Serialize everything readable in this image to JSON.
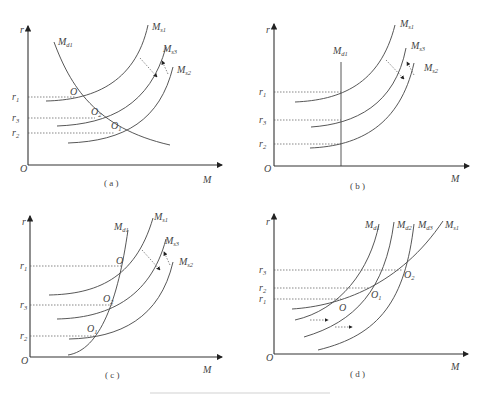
{
  "figure": {
    "caption": "",
    "panels": [
      {
        "id": "a",
        "caption": "( a )",
        "axis_y": "r",
        "axis_x": "M",
        "origin": "O",
        "curves": [
          "M_s1",
          "M_s3",
          "M_s2",
          "M_d1"
        ],
        "curve_labels": {
          "s1": "M",
          "s1_sub": "s1",
          "s3": "M",
          "s3_sub": "s3",
          "s2": "M",
          "s2_sub": "s2",
          "d1": "M",
          "d1_sub": "d1"
        },
        "rates": {
          "r1": "r",
          "r1_sub": "1",
          "r3": "r",
          "r3_sub": "3",
          "r2": "r",
          "r2_sub": "2"
        },
        "points": {
          "p0": "O",
          "p2": "O",
          "p2_sub": "2",
          "p1": "O",
          "p1_sub": "1"
        }
      },
      {
        "id": "b",
        "caption": "( b )",
        "axis_y": "r",
        "axis_x": "M",
        "origin": "O",
        "curve_labels": {
          "s1": "M",
          "s1_sub": "s1",
          "s3": "M",
          "s3_sub": "s3",
          "s2": "M",
          "s2_sub": "s2",
          "d1": "M",
          "d1_sub": "d1"
        },
        "rates": {
          "r1": "r",
          "r1_sub": "1",
          "r3": "r",
          "r3_sub": "3",
          "r2": "r",
          "r2_sub": "2"
        }
      },
      {
        "id": "c",
        "caption": "( c )",
        "axis_y": "r",
        "axis_x": "M",
        "origin": "O",
        "curve_labels": {
          "s1": "M",
          "s1_sub": "s1",
          "s3": "M",
          "s3_sub": "s3",
          "s2": "M",
          "s2_sub": "s2",
          "d1": "M",
          "d1_sub": "d1"
        },
        "rates": {
          "r1": "r",
          "r1_sub": "1",
          "r3": "r",
          "r3_sub": "3",
          "r2": "r",
          "r2_sub": "2"
        },
        "points": {
          "p0": "O",
          "p2": "O",
          "p2_sub": "2",
          "p1": "O",
          "p1_sub": "1"
        }
      },
      {
        "id": "d",
        "caption": "( d )",
        "axis_y": "r",
        "axis_x": "M",
        "origin": "O",
        "curve_labels": {
          "d1": "M",
          "d1_sub": "d1",
          "d2": "M",
          "d2_sub": "d2",
          "d3": "M",
          "d3_sub": "d3",
          "s1": "M",
          "s1_sub": "s1"
        },
        "rates": {
          "r3": "r",
          "r3_sub": "3",
          "r2": "r",
          "r2_sub": "2",
          "r1": "r",
          "r1_sub": "1"
        },
        "points": {
          "p0": "O",
          "p1": "O",
          "p1_sub": "1",
          "p2": "O",
          "p2_sub": "2"
        }
      }
    ]
  }
}
